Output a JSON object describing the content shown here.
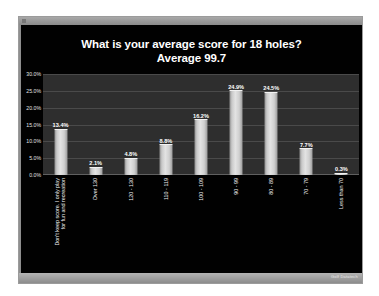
{
  "window": {
    "statusbar_mark": "Golf Datatech"
  },
  "chart_data": {
    "type": "bar",
    "title": "What is your average score for 18 holes?",
    "subtitle": "Average 99.7",
    "xlabel": "",
    "ylabel": "",
    "ylim": [
      0,
      30
    ],
    "grid": true,
    "legend": "none",
    "ytick_labels": [
      "30.0%",
      "25.0%",
      "20.0%",
      "15.0%",
      "10.0%",
      "5.0%",
      "0.0%"
    ],
    "ytick_values": [
      30,
      25,
      20,
      15,
      10,
      5,
      0
    ],
    "categories": [
      "Don't keep score.  I only play|for fun and recreation",
      "Over 130",
      "120 - 130",
      "110 - 119",
      "100 - 109",
      "90 - 99",
      "80 - 89",
      "70 - 79",
      "Less than 70"
    ],
    "values": [
      13.4,
      2.1,
      4.8,
      8.8,
      16.2,
      24.9,
      24.5,
      7.7,
      0.3
    ],
    "value_labels": [
      "13.4%",
      "2.1%",
      "4.8%",
      "8.8%",
      "16.2%",
      "24.9%",
      "24.5%",
      "7.7%",
      "0.3%"
    ]
  }
}
